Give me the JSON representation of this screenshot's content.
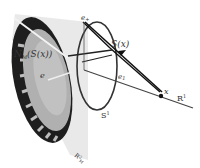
{
  "diagram": {
    "labels": {
      "e_plus": "e",
      "e_plus_sub": "+",
      "s_of_x": "S(x)",
      "e1": "e",
      "e1_sub": "1",
      "x": "x",
      "r1": "R",
      "r1_sup": "1",
      "s1": "S",
      "s1_sup": "1",
      "n_of_s": "N",
      "n_of_s_sub": "M",
      "n_of_s_arg": "(S(x))",
      "e_minus": "e",
      "e_minus_sub": "−",
      "plane": "R",
      "plane_sup": "2",
      "plane_sub": "M"
    },
    "colors": {
      "stroke": "#222222",
      "disc_light": "#b5b5b5",
      "disc_dark": "#1e1e1e",
      "plane": "#e2e2e2"
    }
  }
}
